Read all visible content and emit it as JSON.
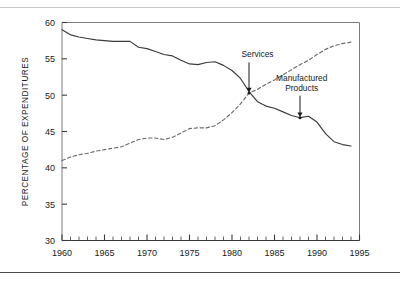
{
  "chart_data": {
    "type": "line",
    "title": "",
    "xlabel": "",
    "ylabel": "PERCENTAGE OF EXPENDITURES",
    "xlim": [
      1960,
      1995
    ],
    "ylim": [
      30,
      60
    ],
    "xticks": [
      1960,
      1965,
      1970,
      1975,
      1980,
      1985,
      1990,
      1995
    ],
    "xtick_labels": [
      "1960",
      "1965",
      "1970",
      "1975",
      "1980",
      "1985",
      "1990",
      "1995"
    ],
    "yticks": [
      30,
      35,
      40,
      45,
      50,
      55,
      60
    ],
    "ytick_labels": [
      "30",
      "35",
      "40",
      "45",
      "50",
      "55",
      "60"
    ],
    "minor_xtick_interval": 1,
    "grid": false,
    "legend": "none",
    "x": [
      1960,
      1961,
      1962,
      1963,
      1964,
      1965,
      1966,
      1967,
      1968,
      1969,
      1970,
      1971,
      1972,
      1973,
      1974,
      1975,
      1976,
      1977,
      1978,
      1979,
      1980,
      1981,
      1982,
      1983,
      1984,
      1985,
      1986,
      1987,
      1988,
      1989,
      1990,
      1991,
      1992,
      1993,
      1994
    ],
    "series": [
      {
        "name": "Manufactured Products",
        "style": "solid",
        "color": "#3a3a3a",
        "values": [
          59.0,
          58.3,
          58.0,
          57.8,
          57.6,
          57.5,
          57.4,
          57.4,
          57.4,
          56.6,
          56.4,
          56.0,
          55.6,
          55.4,
          54.8,
          54.3,
          54.2,
          54.5,
          54.6,
          54.1,
          53.4,
          52.3,
          50.5,
          49.1,
          48.5,
          48.2,
          47.7,
          47.2,
          46.9,
          47.1,
          46.3,
          44.7,
          43.6,
          43.2,
          43.0
        ]
      },
      {
        "name": "Services",
        "style": "dashed",
        "color": "#6a6a6a",
        "values": [
          41.0,
          41.5,
          41.8,
          42.0,
          42.3,
          42.5,
          42.7,
          42.9,
          43.4,
          43.9,
          44.1,
          44.1,
          43.9,
          44.2,
          44.8,
          45.4,
          45.5,
          45.5,
          45.8,
          46.6,
          47.6,
          48.8,
          50.3,
          50.8,
          51.5,
          52.1,
          52.8,
          53.5,
          54.2,
          54.8,
          55.6,
          56.3,
          56.8,
          57.1,
          57.3
        ]
      }
    ],
    "annotations": [
      {
        "label": "Services",
        "text_x": 1983.0,
        "text_y": 55.2,
        "point_x": 1982.0,
        "point_y": 50.3
      },
      {
        "label_line1": "Manufactured",
        "label_line2": "Products",
        "text_x": 1988.2,
        "text_y": 52.0,
        "point_x": 1988.0,
        "point_y": 46.9
      }
    ]
  }
}
